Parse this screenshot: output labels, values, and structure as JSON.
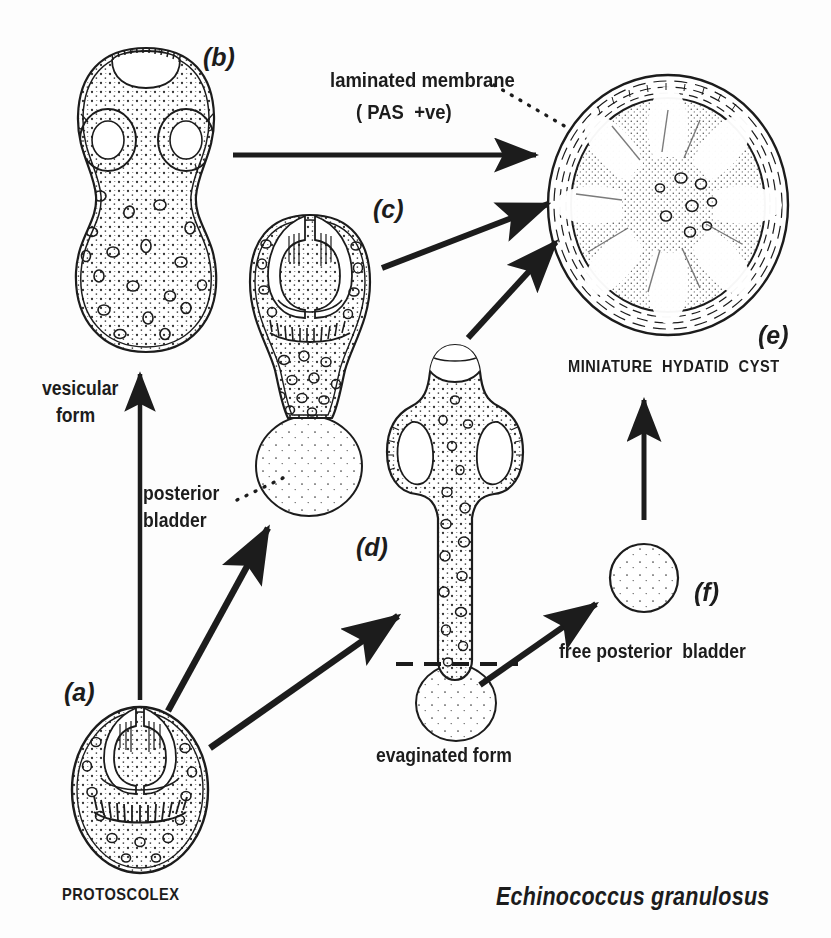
{
  "figure": {
    "organism": "Echinococcus granulosus",
    "title_text": "Echinococcus granulosus",
    "background_color": "#fdfdfd",
    "ink_color": "#1c1c1c"
  },
  "stage_letters": {
    "a": "(a)",
    "b": "(b)",
    "c": "(c)",
    "d": "(d)",
    "e": "(e)",
    "f": "(f)"
  },
  "labels": {
    "protoscolex": "PROTOSCOLEX",
    "vesicular_form_line1": "vesicular",
    "vesicular_form_line2": "form",
    "posterior_bladder_line1": "posterior",
    "posterior_bladder_line2": "bladder",
    "laminated_membrane": "laminated membrane",
    "pas_positive": "( PAS  +ve)",
    "miniature_hydatid_cyst": "MINIATURE  HYDATID  CYST",
    "evaginated_form": "evaginated form",
    "free_posterior_bladder": "free posterior  bladder"
  },
  "diagram_data": {
    "type": "biological-developmental-cycle",
    "nodes": [
      {
        "id": "a",
        "letter": "(a)",
        "name": "PROTOSCOLEX",
        "shape": "oval-invaginated",
        "description": "Invaginated protoscolex with rostellar hooks and four suckers",
        "cx": 140,
        "cy": 790
      },
      {
        "id": "b",
        "letter": "(b)",
        "name": "vesicular form",
        "shape": "peanut-vesicle",
        "description": "Vesicular form with rostellum and two visible suckers",
        "cx": 150,
        "cy": 210
      },
      {
        "id": "c",
        "letter": "(c)",
        "name": "posterior bladder",
        "shape": "body-with-posterior-bladder",
        "description": "Invaginated scolex bearing a posterior bladder",
        "cx": 310,
        "cy": 360
      },
      {
        "id": "d",
        "letter": "(d)",
        "name": "evaginated form",
        "shape": "elongate-evaginated",
        "description": "Evaginated form with everted rostellum, hooks and a posterior bladder separated by a dashed line",
        "cx": 455,
        "cy": 560
      },
      {
        "id": "e",
        "letter": "(e)",
        "name": "MINIATURE HYDATID CYST",
        "shape": "laminated-cyst",
        "description": "Miniature hydatid cyst with PAS positive laminated membrane",
        "cx": 670,
        "cy": 205
      },
      {
        "id": "f",
        "letter": "(f)",
        "name": "free posterior bladder",
        "shape": "small-circle",
        "description": "Detached free posterior bladder",
        "cx": 644,
        "cy": 578
      }
    ],
    "arrows": [
      {
        "from": "a",
        "to": "b",
        "style": "solid",
        "label": "vesicular form"
      },
      {
        "from": "a",
        "to": "c",
        "style": "solid",
        "label": "posterior bladder"
      },
      {
        "from": "a",
        "to": "d",
        "style": "solid",
        "label": "evaginated form"
      },
      {
        "from": "b",
        "to": "e",
        "style": "solid",
        "label": ""
      },
      {
        "from": "c",
        "to": "e",
        "style": "solid",
        "label": ""
      },
      {
        "from": "d",
        "to": "e",
        "style": "solid",
        "label": ""
      },
      {
        "from": "d",
        "to": "f",
        "style": "solid",
        "label": "free posterior bladder"
      },
      {
        "from": "f",
        "to": "e",
        "style": "solid",
        "label": ""
      }
    ],
    "leaders": [
      {
        "from_label": "laminated membrane",
        "to_node": "e",
        "style": "dotted"
      },
      {
        "from_label": "posterior bladder",
        "to_node": "c",
        "style": "dotted"
      }
    ]
  }
}
